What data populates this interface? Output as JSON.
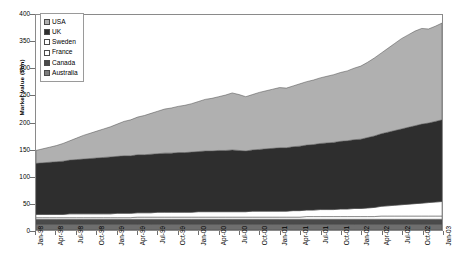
{
  "chart_data": {
    "type": "area",
    "stacked": true,
    "title": "",
    "xlabel": "",
    "ylabel": "Market value ($bn)",
    "ylim": [
      0,
      400
    ],
    "ytick_values": [
      0,
      50,
      100,
      150,
      200,
      250,
      300,
      350,
      400
    ],
    "ytick_labels": [
      "0",
      "50",
      "100",
      "150",
      "200",
      "250",
      "300",
      "350",
      "400"
    ],
    "grid": false,
    "legend_position": "top-left",
    "x": [
      "Jan-98",
      "Feb-98",
      "Mar-98",
      "Apr-98",
      "May-98",
      "Jun-98",
      "Jul-98",
      "Aug-98",
      "Sep-98",
      "Oct-98",
      "Nov-98",
      "Dec-98",
      "Jan-99",
      "Feb-99",
      "Mar-99",
      "Apr-99",
      "May-99",
      "Jun-99",
      "Jul-99",
      "Aug-99",
      "Sep-99",
      "Oct-99",
      "Nov-99",
      "Dec-99",
      "Jan-00",
      "Feb-00",
      "Mar-00",
      "Apr-00",
      "May-00",
      "Jun-00",
      "Jul-00",
      "Aug-00",
      "Sep-00",
      "Oct-00",
      "Nov-00",
      "Dec-00",
      "Jan-01",
      "Feb-01",
      "Mar-01",
      "Apr-01",
      "May-01",
      "Jun-01",
      "Jul-01",
      "Aug-01",
      "Sep-01",
      "Oct-01",
      "Nov-01",
      "Dec-01",
      "Jan-02",
      "Feb-02",
      "Mar-02",
      "Apr-02",
      "May-02",
      "Jun-02",
      "Jul-02",
      "Aug-02",
      "Sep-02",
      "Oct-02",
      "Nov-02",
      "Dec-02",
      "Jan-03"
    ],
    "xtick_labels": [
      "Jan-98",
      "Apr-98",
      "Jul-98",
      "Oct-98",
      "Jan-99",
      "Apr-99",
      "Jul-99",
      "Oct-99",
      "Jan-00",
      "Apr-00",
      "Jul-00",
      "Oct-00",
      "Jan-01",
      "Apr-01",
      "Jul-01",
      "Oct-01",
      "Jan-02",
      "Apr-02",
      "Jul-02",
      "Oct-02",
      "Jan-03"
    ],
    "xtick_indices": [
      0,
      3,
      6,
      9,
      12,
      15,
      18,
      21,
      24,
      27,
      30,
      33,
      36,
      39,
      42,
      45,
      48,
      51,
      54,
      57,
      60
    ],
    "stack_order_bottom_to_top": [
      "Australia",
      "Canada",
      "France",
      "Sweden",
      "UK",
      "USA"
    ],
    "series": [
      {
        "name": "USA",
        "color": "#b0b0b0",
        "values": [
          24,
          26,
          28,
          30,
          33,
          36,
          40,
          44,
          47,
          50,
          53,
          56,
          60,
          64,
          67,
          70,
          73,
          76,
          79,
          82,
          84,
          86,
          88,
          90,
          93,
          96,
          98,
          100,
          103,
          106,
          104,
          101,
          103,
          106,
          108,
          110,
          112,
          111,
          113,
          116,
          118,
          120,
          122,
          124,
          126,
          128,
          130,
          133,
          136,
          140,
          145,
          150,
          156,
          162,
          168,
          172,
          176,
          178,
          175,
          177,
          180
        ]
      },
      {
        "name": "UK",
        "color": "#2e2e2e",
        "values": [
          95,
          96,
          97,
          98,
          99,
          100,
          101,
          102,
          103,
          104,
          105,
          106,
          106,
          107,
          107,
          108,
          108,
          109,
          109,
          110,
          110,
          111,
          111,
          112,
          112,
          113,
          113,
          114,
          114,
          115,
          114,
          113,
          114,
          115,
          116,
          117,
          118,
          118,
          119,
          120,
          121,
          122,
          123,
          124,
          125,
          126,
          127,
          128,
          129,
          131,
          133,
          135,
          137,
          139,
          141,
          143,
          145,
          147,
          148,
          150,
          152
        ]
      },
      {
        "name": "Sweden",
        "color": "#ffffff",
        "values": [
          6,
          6,
          6,
          6,
          6,
          7,
          7,
          7,
          7,
          7,
          7,
          7,
          8,
          8,
          8,
          8,
          8,
          8,
          9,
          9,
          9,
          9,
          9,
          9,
          10,
          10,
          10,
          10,
          10,
          10,
          10,
          10,
          11,
          11,
          11,
          11,
          11,
          11,
          12,
          12,
          12,
          12,
          13,
          13,
          13,
          14,
          14,
          15,
          15,
          16,
          17,
          18,
          19,
          20,
          21,
          22,
          23,
          24,
          25,
          26,
          27
        ]
      },
      {
        "name": "France",
        "color": "#ffffff",
        "values": [
          3,
          3,
          3,
          3,
          3,
          3,
          3,
          3,
          3,
          3,
          3,
          3,
          3,
          3,
          3,
          4,
          4,
          4,
          4,
          4,
          4,
          4,
          4,
          4,
          4,
          4,
          4,
          4,
          4,
          4,
          4,
          4,
          4,
          4,
          4,
          4,
          4,
          4,
          4,
          4,
          5,
          5,
          5,
          5,
          5,
          5,
          5,
          5,
          5,
          5,
          5,
          6,
          6,
          6,
          6,
          6,
          6,
          6,
          6,
          6,
          6
        ]
      },
      {
        "name": "Canada",
        "color": "#4a4a4a",
        "values": [
          9,
          9,
          9,
          9,
          9,
          9,
          9,
          9,
          9,
          9,
          9,
          9,
          9,
          9,
          9,
          9,
          9,
          9,
          9,
          9,
          9,
          9,
          9,
          9,
          9,
          9,
          9,
          9,
          9,
          9,
          9,
          9,
          9,
          9,
          9,
          9,
          9,
          9,
          9,
          9,
          9,
          9,
          9,
          9,
          9,
          9,
          9,
          9,
          9,
          9,
          9,
          9,
          9,
          9,
          9,
          9,
          9,
          9,
          9,
          9,
          9
        ]
      },
      {
        "name": "Australia",
        "color": "#6e6e6e",
        "values": [
          11,
          11,
          11,
          11,
          11,
          11,
          11,
          11,
          11,
          11,
          11,
          11,
          11,
          11,
          11,
          11,
          11,
          11,
          11,
          11,
          11,
          11,
          11,
          11,
          11,
          11,
          11,
          11,
          11,
          11,
          11,
          11,
          11,
          11,
          11,
          11,
          11,
          11,
          11,
          11,
          11,
          11,
          11,
          11,
          11,
          11,
          11,
          11,
          11,
          11,
          11,
          11,
          11,
          11,
          11,
          11,
          11,
          11,
          11,
          11,
          11
        ]
      }
    ],
    "legend": [
      {
        "label": "USA",
        "color": "#b0b0b0"
      },
      {
        "label": "UK",
        "color": "#2e2e2e"
      },
      {
        "label": "Sweden",
        "color": "#ffffff"
      },
      {
        "label": "France",
        "color": "#ffffff"
      },
      {
        "label": "Canada",
        "color": "#4a4a4a"
      },
      {
        "label": "Australia",
        "color": "#7d7d7d"
      }
    ]
  }
}
